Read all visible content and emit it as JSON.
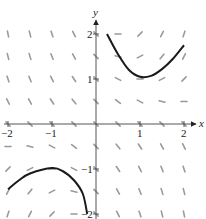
{
  "diagram": {
    "type": "slope_field",
    "equation": "dy/dx = xy - 1",
    "x_axis": {
      "label": "x",
      "min": -2,
      "max": 2,
      "ticks": [
        -2,
        -1,
        1,
        2
      ],
      "tick_labels": [
        "−2",
        "−1",
        "1",
        "2"
      ]
    },
    "y_axis": {
      "label": "y",
      "min": -2,
      "max": 2,
      "ticks": [
        -2,
        -1,
        1,
        2
      ],
      "tick_labels": [
        "−2",
        "−1",
        "1",
        "2"
      ]
    },
    "field_color": "#9a9a9a",
    "curve_color": "#1a1a1a",
    "axis_color": "#555555",
    "grid_step": 0.5,
    "solution_curves": [
      {
        "name": "upper-solution-curve",
        "points": [
          [
            0.25,
            2.0
          ],
          [
            0.5,
            1.55
          ],
          [
            0.75,
            1.2
          ],
          [
            1.0,
            1.05
          ],
          [
            1.25,
            1.07
          ],
          [
            1.5,
            1.22
          ],
          [
            1.75,
            1.45
          ],
          [
            2.0,
            1.75
          ]
        ]
      },
      {
        "name": "lower-solution-curve",
        "points": [
          [
            -2.0,
            -1.45
          ],
          [
            -1.75,
            -1.25
          ],
          [
            -1.5,
            -1.1
          ],
          [
            -1.0,
            -0.98
          ],
          [
            -0.75,
            -1.05
          ],
          [
            -0.5,
            -1.25
          ],
          [
            -0.3,
            -1.55
          ],
          [
            -0.2,
            -2.0
          ]
        ]
      }
    ]
  }
}
